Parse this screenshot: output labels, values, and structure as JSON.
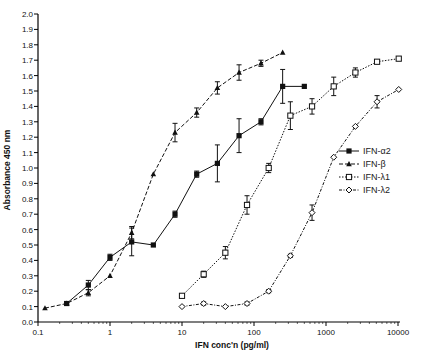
{
  "chart_data": {
    "type": "line",
    "title": "",
    "xlabel": "IFN conc'n (pg/ml)",
    "ylabel": "Absorbance 450 nm",
    "xscale": "log",
    "xlim": [
      0.1,
      10000
    ],
    "ylim": [
      0.0,
      2.0
    ],
    "x_ticks": [
      "0.1",
      "1",
      "10",
      "100",
      "1000",
      "10000"
    ],
    "y_ticks": [
      "0.0",
      "0.1",
      "0.2",
      "0.3",
      "0.4",
      "0.5",
      "0.6",
      "0.7",
      "0.8",
      "0.9",
      "1.0",
      "1.1",
      "1.2",
      "1.3",
      "1.4",
      "1.5",
      "1.6",
      "1.7",
      "1.8",
      "1.9",
      "2.0"
    ],
    "grid": false,
    "legend_position": "right",
    "series": [
      {
        "name": "IFN-α2",
        "marker": "filled-square",
        "line": "solid",
        "x": [
          0.25,
          0.5,
          1,
          2,
          4,
          8,
          16,
          31,
          62,
          125,
          250,
          500
        ],
        "y": [
          0.12,
          0.24,
          0.42,
          0.52,
          0.5,
          0.7,
          0.96,
          1.03,
          1.21,
          1.3,
          1.53,
          1.53
        ],
        "err": [
          0.01,
          0.03,
          0.02,
          0.09,
          0.0,
          0.02,
          0.02,
          0.12,
          0.11,
          0.02,
          0.11,
          0.0
        ]
      },
      {
        "name": "IFN-β",
        "marker": "filled-triangle",
        "line": "dashed",
        "x": [
          0.125,
          0.25,
          0.5,
          1,
          2,
          4,
          8,
          16,
          31,
          62,
          125,
          250
        ],
        "y": [
          0.09,
          0.12,
          0.19,
          0.3,
          0.58,
          0.96,
          1.23,
          1.36,
          1.52,
          1.62,
          1.68,
          1.75
        ],
        "err": [
          0.0,
          0.01,
          0.02,
          0.0,
          0.04,
          0.0,
          0.06,
          0.03,
          0.04,
          0.05,
          0.02,
          0.0
        ]
      },
      {
        "name": "IFN-λ1",
        "marker": "open-square",
        "line": "dotted",
        "x": [
          10,
          20,
          40,
          80,
          160,
          320,
          640,
          1280,
          2560,
          5120,
          10240
        ],
        "y": [
          0.17,
          0.31,
          0.45,
          0.76,
          1.0,
          1.34,
          1.4,
          1.53,
          1.62,
          1.69,
          1.71
        ],
        "err": [
          0.01,
          0.02,
          0.04,
          0.06,
          0.03,
          0.09,
          0.05,
          0.06,
          0.03,
          0.01,
          0.01
        ]
      },
      {
        "name": "IFN-λ2",
        "marker": "open-diamond",
        "line": "dash-dot",
        "x": [
          10,
          20,
          40,
          80,
          160,
          320,
          640,
          1280,
          2560,
          5120,
          10240
        ],
        "y": [
          0.1,
          0.12,
          0.1,
          0.12,
          0.2,
          0.43,
          0.71,
          1.07,
          1.27,
          1.43,
          1.51
        ],
        "err": [
          0.0,
          0.01,
          0.0,
          0.01,
          0.01,
          0.01,
          0.05,
          0.0,
          0.0,
          0.04,
          0.0
        ]
      }
    ]
  },
  "legend": {
    "items": [
      {
        "label": "IFN-α2"
      },
      {
        "label": "IFN-β"
      },
      {
        "label": "IFN-λ1"
      },
      {
        "label": "IFN-λ2"
      }
    ]
  },
  "axes": {
    "xlabel": "IFN conc'n (pg/ml)",
    "ylabel": "Absorbance 450 nm",
    "x_ticks": [
      "0.1",
      "1",
      "10",
      "100",
      "1000",
      "10000"
    ],
    "y_ticks": [
      "0.0",
      "0.1",
      "0.2",
      "0.3",
      "0.4",
      "0.5",
      "0.6",
      "0.7",
      "0.8",
      "0.9",
      "1.0",
      "1.1",
      "1.2",
      "1.3",
      "1.4",
      "1.5",
      "1.6",
      "1.7",
      "1.8",
      "1.9",
      "2.0"
    ]
  }
}
